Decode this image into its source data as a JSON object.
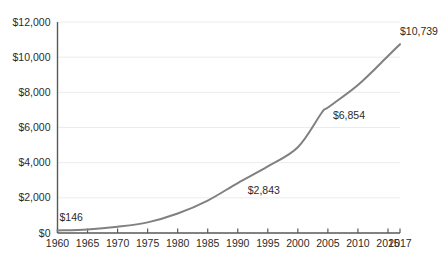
{
  "chart_data": {
    "type": "line",
    "title": "",
    "subtitle": "",
    "xlabel": "",
    "ylabel": "",
    "grid": true,
    "legend": false,
    "legend_position": "none",
    "xlim": [
      1960,
      2017
    ],
    "ylim": [
      0,
      12000
    ],
    "line_color": "#808080",
    "grid_color": "#ececec",
    "axis_color": "#595959",
    "text_color": "#2b2b2b",
    "y_ticks": [
      0,
      2000,
      4000,
      6000,
      8000,
      10000,
      12000
    ],
    "y_tick_labels": [
      "$0",
      "$2,000",
      "$4,000",
      "$6,000",
      "$8,000",
      "$10,000",
      "$12,000"
    ],
    "x_ticks": [
      1960,
      1965,
      1970,
      1975,
      1980,
      1985,
      1990,
      1995,
      2000,
      2005,
      2010,
      2015,
      2017
    ],
    "x_tick_labels": [
      "1960",
      "1965",
      "1970",
      "1975",
      "1980",
      "1985",
      "1990",
      "1995",
      "2000",
      "2005",
      "2010",
      "2015",
      "2017"
    ],
    "x": [
      1960,
      1965,
      1970,
      1975,
      1980,
      1985,
      1990,
      1995,
      2000,
      2004,
      2005,
      2010,
      2015,
      2017
    ],
    "values": [
      146,
      202,
      355,
      605,
      1108,
      1845,
      2843,
      3788,
      4878,
      6854,
      7136,
      8414,
      10062,
      10739
    ],
    "annotations": [
      {
        "label": "$146",
        "x": 1960,
        "y": 146
      },
      {
        "label": "$2,843",
        "x": 1990,
        "y": 2843
      },
      {
        "label": "$6,854",
        "x": 2004,
        "y": 6854
      },
      {
        "label": "$10,739",
        "x": 2017,
        "y": 10739
      }
    ]
  }
}
